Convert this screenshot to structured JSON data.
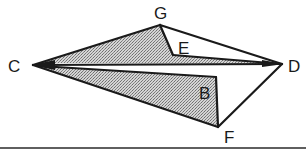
{
  "figure": {
    "type": "geometric-fold-diagram",
    "shading_color": "#b8b8b8",
    "line_color": "#1a1a1a",
    "background": "#ffffff"
  },
  "labels": {
    "C": "C",
    "G": "G",
    "E": "E",
    "D": "D",
    "B": "B",
    "F": "F"
  },
  "vertices": {
    "C": [
      33,
      65
    ],
    "G": [
      160,
      25
    ],
    "E_inner": [
      173,
      55
    ],
    "D": [
      282,
      64
    ],
    "B_corner": [
      216,
      78
    ],
    "F": [
      218,
      127
    ]
  },
  "regions": [
    {
      "name": "upper-shaded-region-E",
      "shaded": true
    },
    {
      "name": "lower-shaded-region-B",
      "shaded": true
    },
    {
      "name": "white-gap-CD",
      "shaded": false
    },
    {
      "name": "white-triangle-BDF",
      "shaded": false
    }
  ]
}
